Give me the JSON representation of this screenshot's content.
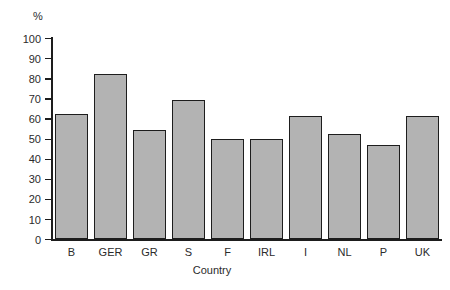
{
  "chart_data": {
    "type": "bar",
    "title": "",
    "subtitle": "",
    "xlabel": "Country",
    "ylabel": "%",
    "categories": [
      "B",
      "GER",
      "GR",
      "S",
      "F",
      "IRL",
      "I",
      "NL",
      "P",
      "UK"
    ],
    "values": [
      62,
      82,
      54,
      69,
      50,
      50,
      61,
      52,
      47,
      61
    ],
    "ylim": [
      0,
      100
    ],
    "ytick_labels": [
      "0",
      "10",
      "20",
      "30",
      "40",
      "50",
      "60",
      "70",
      "80",
      "90",
      "100"
    ],
    "ytick_values": [
      0,
      10,
      20,
      30,
      40,
      50,
      60,
      70,
      80,
      90,
      100
    ],
    "grid": false,
    "legend": false,
    "legend_position": "none",
    "bar_fill_color": "#b3b3b3",
    "bar_edge_color": "#1d1d1d",
    "axis_color": "#1d1d1d",
    "background_color": "#ffffff",
    "annotations": []
  }
}
